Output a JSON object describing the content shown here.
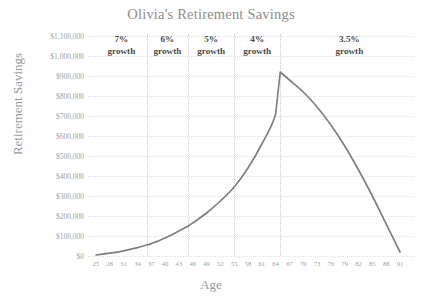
{
  "chart_data": {
    "type": "line",
    "title": "Olivia's Retirement Savings",
    "xlabel": "Age",
    "ylabel": "Retirement Savings",
    "xlim": [
      25,
      91
    ],
    "ylim": [
      0,
      1100000
    ],
    "grid": true,
    "legend": "none",
    "line_color": "#808080",
    "x_ticks": [
      25,
      28,
      31,
      34,
      37,
      40,
      43,
      46,
      49,
      52,
      55,
      58,
      61,
      64,
      67,
      70,
      73,
      76,
      79,
      82,
      85,
      88,
      91
    ],
    "y_ticks": [
      0,
      100000,
      200000,
      300000,
      400000,
      500000,
      600000,
      700000,
      800000,
      900000,
      1000000,
      1100000
    ],
    "y_tick_labels": [
      "$0",
      "$100,000",
      "$200,000",
      "$300,000",
      "$400,000",
      "$500,000",
      "$600,000",
      "$700,000",
      "$800,000",
      "$900,000",
      "$1,000,000",
      "$1,100,000"
    ],
    "x": [
      25,
      28,
      31,
      34,
      36,
      37,
      40,
      43,
      45,
      46,
      49,
      52,
      55,
      58,
      61,
      64,
      65,
      67,
      70,
      73,
      76,
      79,
      82,
      85,
      88,
      91
    ],
    "values": [
      5000,
      14000,
      26000,
      42000,
      55000,
      62000,
      90000,
      125000,
      150000,
      165000,
      215000,
      275000,
      345000,
      440000,
      560000,
      710000,
      920000,
      880000,
      820000,
      745000,
      655000,
      550000,
      430000,
      300000,
      160000,
      20000
    ],
    "series": [
      {
        "name": "Retirement Savings",
        "values": [
          5000,
          14000,
          26000,
          42000,
          55000,
          62000,
          90000,
          125000,
          150000,
          165000,
          215000,
          275000,
          345000,
          440000,
          560000,
          710000,
          920000,
          880000,
          820000,
          745000,
          655000,
          550000,
          430000,
          300000,
          160000,
          20000
        ]
      }
    ],
    "peak": {
      "age": 65,
      "value": 920000
    },
    "dividers": [
      36,
      45,
      55,
      65
    ],
    "annotations": [
      {
        "label_rate": "7%",
        "label_word": "growth",
        "age_center": 30.5
      },
      {
        "label_rate": "6%",
        "label_word": "growth",
        "age_center": 40.5
      },
      {
        "label_rate": "5%",
        "label_word": "growth",
        "age_center": 50
      },
      {
        "label_rate": "4%",
        "label_word": "growth",
        "age_center": 60
      },
      {
        "label_rate": "3.5%",
        "label_word": "growth",
        "age_center": 80
      }
    ]
  }
}
